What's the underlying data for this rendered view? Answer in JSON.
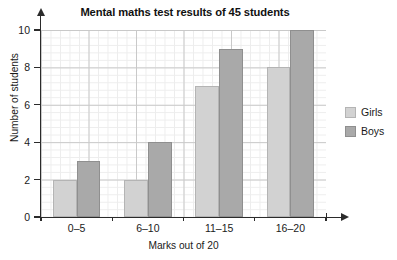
{
  "chart_data": {
    "type": "bar",
    "title": "Mental maths test results of 45 students",
    "xlabel": "Marks out of 20",
    "ylabel": "Number of students",
    "categories": [
      "0–5",
      "6–10",
      "11–15",
      "16–20"
    ],
    "series": [
      {
        "name": "Girls",
        "values": [
          2,
          2,
          7,
          8
        ],
        "color": "#d2d2d2"
      },
      {
        "name": "Boys",
        "values": [
          3,
          4,
          9,
          10
        ],
        "color": "#a9a9a9"
      }
    ],
    "ylim": [
      0,
      10
    ],
    "ytick_labels": [
      "0",
      "2",
      "4",
      "6",
      "8",
      "10"
    ],
    "ytick_values": [
      0,
      2,
      4,
      6,
      8,
      10
    ],
    "grid": true,
    "minor_grid": true,
    "legend_position": "right",
    "total_students": 45
  },
  "legend": {
    "entries": [
      {
        "label": "Girls",
        "swatch": "girls-swatch"
      },
      {
        "label": "Boys",
        "swatch": "boys-swatch"
      }
    ]
  },
  "axes": {
    "y_arrow_icon": "arrow-up-icon",
    "x_arrow_icon": "arrow-right-icon"
  },
  "colors": {
    "girls": "#d2d2d2",
    "boys": "#a9a9a9",
    "axis": "#2b2b2b",
    "grid_major": "#c9c9c9",
    "grid_minor": "#ededed"
  }
}
